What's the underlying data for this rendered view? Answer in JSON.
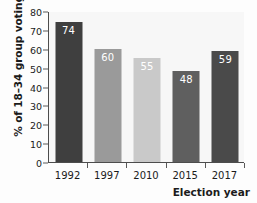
{
  "chart_data": {
    "type": "bar",
    "title": "",
    "subtitle": "",
    "xlabel": "Election year",
    "ylabel": "% of 18–34 group voting",
    "categories": [
      "1992",
      "1997",
      "2010",
      "2015",
      "2017"
    ],
    "values": [
      74,
      60,
      55,
      48,
      59
    ],
    "data_labels": [
      "74",
      "60",
      "55",
      "48",
      "59"
    ],
    "bar_colors": [
      "#3f3f3f",
      "#9a9a9a",
      "#c9c9c9",
      "#5f5f5f",
      "#4a4a4a"
    ],
    "ylim": [
      0,
      80
    ],
    "ytick_step": 10,
    "ytick_labels": [
      "0",
      "10",
      "20",
      "30",
      "40",
      "50",
      "60",
      "70",
      "80"
    ],
    "ytick_values": [
      0,
      10,
      20,
      30,
      40,
      50,
      60,
      70,
      80
    ],
    "xtick_labels": [
      "1992",
      "1997",
      "2010",
      "2015",
      "2017"
    ],
    "grid": false,
    "legend": null,
    "legend_position": "none",
    "plot_background": "#f7f7f7",
    "axis_color": "#4d4d4d",
    "label_text_color": "#ffffff"
  }
}
